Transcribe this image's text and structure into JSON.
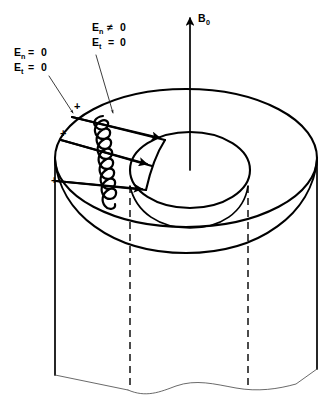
{
  "figure": {
    "background_color": "#ffffff",
    "line_color": "#000000"
  },
  "labels": {
    "axial_field": {
      "symbol": "B",
      "subscript": "0",
      "full_text": "B0",
      "name": "axial magnetic field arrow label"
    },
    "boundary_left": {
      "line1_symbol": "E",
      "line1_subscript": "n",
      "line1_relation": "=",
      "line1_value": "0",
      "line2_symbol": "E",
      "line2_subscript": "t",
      "line2_relation": "=",
      "line2_value": "0",
      "full_text": "En = 0 ; Et = 0"
    },
    "boundary_right": {
      "line1_symbol": "E",
      "line1_subscript": "n",
      "line1_relation": "≠",
      "line1_value": "0",
      "line2_symbol": "E",
      "line2_subscript": "t",
      "line2_relation": "=",
      "line2_value": "0",
      "full_text": "En ≠ 0 ; Et = 0"
    },
    "charge_marks": [
      {
        "text": "+",
        "x": 74,
        "y": 110
      },
      {
        "text": "+",
        "x": 60,
        "y": 137
      },
      {
        "text": "+",
        "x": 51,
        "y": 184
      }
    ]
  },
  "geometry": {
    "outer_top_ellipse": {
      "cx": 186,
      "cy": 158,
      "rx": 131,
      "ry": 69
    },
    "inner_top_ellipse": {
      "cx": 190,
      "cy": 170,
      "rx": 60,
      "ry": 38
    },
    "axis_arrow": {
      "x": 190,
      "y_top": 14,
      "y_bottom": 170
    },
    "hidden_edges_x": [
      130,
      248
    ],
    "cylinder_left_wall_x": 55,
    "cylinder_right_wall_x": 317,
    "break_line_y": 383,
    "coil_turns": 9,
    "radial_arrows": 3
  }
}
